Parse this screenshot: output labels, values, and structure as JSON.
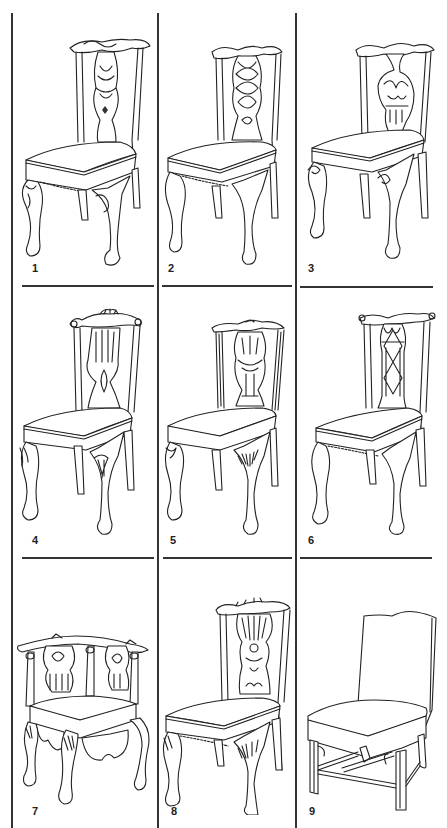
{
  "plate": {
    "grid": {
      "rows": 3,
      "cols": 3
    },
    "colors": {
      "line": "#222222",
      "background": "#ffffff"
    }
  },
  "chairs": [
    {
      "number": "1",
      "back": "carved-urn-splat",
      "legs": "cabriole-ball-and-claw",
      "knee": "carved-scroll"
    },
    {
      "number": "2",
      "back": "interlaced-gothic-splat",
      "legs": "cabriole-ball-and-claw",
      "knee": "plain"
    },
    {
      "number": "3",
      "back": "pierced-scroll-splat",
      "legs": "cabriole-ball-and-claw",
      "knee": "scroll-bracket"
    },
    {
      "number": "4",
      "back": "vertical-slat-splat-with-shell",
      "legs": "cabriole-ball-and-claw",
      "knee": "shell"
    },
    {
      "number": "5",
      "back": "carved-vase-splat",
      "legs": "cabriole-ball-and-claw",
      "knee": "acanthus"
    },
    {
      "number": "6",
      "back": "diamond-interlaced-splat",
      "legs": "cabriole-ball-and-claw",
      "knee": "plain"
    },
    {
      "number": "7",
      "back": "corner-chair-pierced-splats",
      "legs": "cabriole-ball-and-claw",
      "knee": "acanthus"
    },
    {
      "number": "8",
      "back": "ribbon-pierced-splat",
      "legs": "cabriole-ball-and-claw",
      "knee": "acanthus"
    },
    {
      "number": "9",
      "back": "upholstered-serpentine",
      "legs": "straight-molded-with-stretchers",
      "knee": "brackets"
    }
  ]
}
